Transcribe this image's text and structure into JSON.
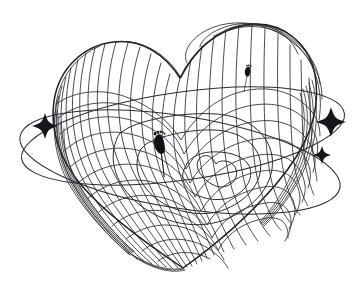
{
  "artwork": {
    "title": "Wireframe Heart with Orbital Rings",
    "subject": "heart",
    "style": "3d-wireframe-line-art",
    "background_color": "#ffffff",
    "line_color": "#2b2b33",
    "accent_color": "#101016",
    "canvas": {
      "width": 360,
      "height": 288
    }
  },
  "heart": {
    "name": "wireframe-heart",
    "center_x": 183,
    "center_y": 148,
    "width": 262,
    "height": 248,
    "mesh": {
      "type": "latitude-longitude",
      "longitude_count": 26,
      "latitude_count": 20,
      "stroke_width": 0.85
    }
  },
  "orbits": [
    {
      "name": "orbit-ring-upper",
      "center_x": 183,
      "center_y": 136,
      "rx": 163,
      "ry": 44,
      "rotation_deg": -8
    },
    {
      "name": "orbit-ring-lower",
      "center_x": 180,
      "center_y": 162,
      "rx": 162,
      "ry": 46,
      "rotation_deg": 9
    }
  ],
  "sparkles": [
    {
      "name": "sparkle-left",
      "x": 45,
      "y": 126,
      "size": 13
    },
    {
      "name": "sparkle-right-large",
      "x": 331,
      "y": 122,
      "size": 15
    },
    {
      "name": "sparkle-right-small",
      "x": 322,
      "y": 155,
      "size": 9
    }
  ],
  "footprints": [
    {
      "name": "footprint-center",
      "x": 160,
      "y": 143,
      "size": 1.0,
      "rotation_deg": -4
    },
    {
      "name": "footprint-upper-right",
      "x": 248,
      "y": 71,
      "size": 0.52,
      "rotation_deg": 14
    }
  ],
  "inner_contours": [
    {
      "name": "inner-contour-outer-lobe"
    },
    {
      "name": "inner-contour-mid-lobe"
    },
    {
      "name": "inner-contour-small-heart"
    }
  ]
}
